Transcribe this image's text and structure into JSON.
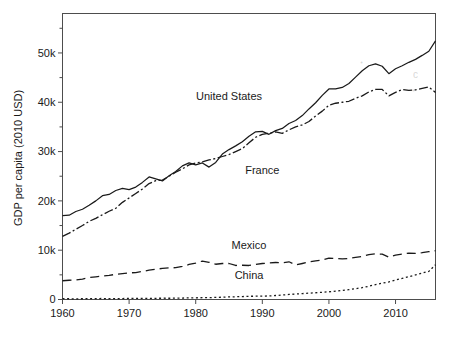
{
  "figure": {
    "background_color": "#ffffff",
    "line_color": "#1a1a1a",
    "frame_color": "#4d4d4d"
  },
  "chart_data": {
    "type": "line",
    "title": "",
    "xlabel": "",
    "ylabel": "GDP per capita (2010 USD)",
    "xlim": [
      1960,
      2016
    ],
    "ylim": [
      0,
      58000
    ],
    "grid": false,
    "legend": "inline-labels",
    "xticks": [
      1960,
      1970,
      1980,
      1990,
      2000,
      2010
    ],
    "xtick_labels": [
      "1960",
      "1970",
      "1980",
      "1990",
      "2000",
      "2010"
    ],
    "yticks": [
      0,
      10000,
      20000,
      30000,
      40000,
      50000
    ],
    "ytick_labels": [
      "0",
      "10k",
      "20k",
      "30k",
      "40k",
      "50k"
    ],
    "yticks_minor": [
      5000,
      15000,
      25000,
      35000,
      45000,
      55000
    ],
    "x": [
      1960,
      1961,
      1962,
      1963,
      1964,
      1965,
      1966,
      1967,
      1968,
      1969,
      1970,
      1971,
      1972,
      1973,
      1974,
      1975,
      1976,
      1977,
      1978,
      1979,
      1980,
      1981,
      1982,
      1983,
      1984,
      1985,
      1986,
      1987,
      1988,
      1989,
      1990,
      1991,
      1992,
      1993,
      1994,
      1995,
      1996,
      1997,
      1998,
      1999,
      2000,
      2001,
      2002,
      2003,
      2004,
      2005,
      2006,
      2007,
      2008,
      2009,
      2010,
      2011,
      2012,
      2013,
      2014,
      2015,
      2016
    ],
    "series": [
      {
        "name": "United States",
        "linestyle": "solid",
        "dasharray": "none",
        "label_x": 1985,
        "label_y": 40500,
        "values": [
          17000,
          17100,
          17850,
          18300,
          19100,
          20000,
          21050,
          21300,
          22100,
          22550,
          22300,
          22800,
          23750,
          24850,
          24450,
          24050,
          25100,
          25950,
          27100,
          27700,
          27300,
          27700,
          26850,
          27800,
          29500,
          30400,
          31150,
          32000,
          33100,
          34000,
          34100,
          33500,
          34250,
          34700,
          35700,
          36300,
          37300,
          38650,
          39900,
          41400,
          42700,
          42700,
          43000,
          43800,
          45100,
          46400,
          47400,
          47800,
          47300,
          45800,
          46800,
          47400,
          48100,
          48700,
          49500,
          50350,
          52450
        ]
      },
      {
        "name": "France",
        "linestyle": "dashdot",
        "dasharray": "9,2.5,2,2.5",
        "label_x": 1990,
        "label_y": 25500,
        "values": [
          12800,
          13450,
          14250,
          15000,
          15850,
          16450,
          17200,
          17900,
          18500,
          19700,
          20600,
          21500,
          22400,
          23500,
          24100,
          24200,
          25000,
          25800,
          26500,
          27300,
          27700,
          27900,
          28300,
          28600,
          29000,
          29400,
          30000,
          30600,
          31800,
          32900,
          33500,
          33700,
          34000,
          33700,
          34400,
          35000,
          35400,
          36100,
          37200,
          38200,
          39400,
          39800,
          40000,
          40200,
          40800,
          41300,
          42100,
          42600,
          42600,
          41300,
          42000,
          42600,
          42400,
          42500,
          42800,
          43100,
          42000
        ]
      },
      {
        "name": "Mexico",
        "linestyle": "longdash",
        "dasharray": "9,5",
        "label_x": 1988,
        "label_y": 10300,
        "values": [
          3800,
          3900,
          3950,
          4150,
          4450,
          4600,
          4750,
          4900,
          5100,
          5250,
          5400,
          5450,
          5700,
          5950,
          6150,
          6300,
          6400,
          6450,
          6700,
          7100,
          7400,
          7800,
          7550,
          7150,
          7300,
          7300,
          6900,
          6950,
          6900,
          7100,
          7300,
          7400,
          7500,
          7450,
          7650,
          7000,
          7300,
          7600,
          7850,
          8000,
          8400,
          8300,
          8250,
          8300,
          8550,
          8750,
          9100,
          9250,
          9200,
          8600,
          9000,
          9200,
          9400,
          9350,
          9500,
          9700,
          9900
        ]
      },
      {
        "name": "China",
        "linestyle": "dotted",
        "dasharray": "2,2.6",
        "label_x": 1988,
        "label_y": 4250,
        "values": [
          190,
          150,
          140,
          150,
          170,
          190,
          200,
          185,
          175,
          195,
          220,
          230,
          235,
          245,
          245,
          260,
          255,
          270,
          295,
          320,
          345,
          360,
          385,
          420,
          470,
          525,
          555,
          600,
          655,
          665,
          680,
          720,
          810,
          910,
          1020,
          1110,
          1200,
          1290,
          1370,
          1460,
          1570,
          1690,
          1830,
          2000,
          2190,
          2410,
          2690,
          3030,
          3300,
          3580,
          3940,
          4290,
          4640,
          4980,
          5350,
          5700,
          7050
        ]
      }
    ]
  },
  "artifacts": [
    {
      "name": "scan-smudge-1",
      "glyph": "ꞏ",
      "x": 360,
      "y": 66
    },
    {
      "name": "scan-smudge-2",
      "glyph": "c",
      "x": 413,
      "y": 78
    },
    {
      "name": "scan-smudge-3",
      "glyph": "ꞏ",
      "x": 412,
      "y": 94
    }
  ]
}
